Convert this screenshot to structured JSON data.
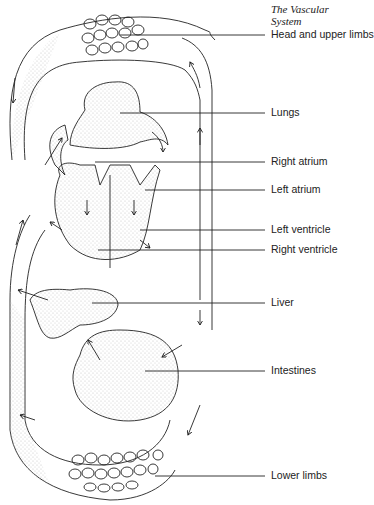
{
  "header": {
    "title": "The Vascular System"
  },
  "labels": [
    {
      "text": "Head and upper limbs",
      "y": 26
    },
    {
      "text": "Lungs",
      "y": 107
    },
    {
      "text": "Right atrium",
      "y": 152
    },
    {
      "text": "Left atrium",
      "y": 181
    },
    {
      "text": "Left ventricle",
      "y": 222
    },
    {
      "text": "Right ventricle",
      "y": 240
    },
    {
      "text": "Liver",
      "y": 292
    },
    {
      "text": "Intestines",
      "y": 361
    },
    {
      "text": "Lower limbs",
      "y": 465
    }
  ],
  "colors": {
    "line": "#222222",
    "stipple": "#bdbdbd"
  }
}
